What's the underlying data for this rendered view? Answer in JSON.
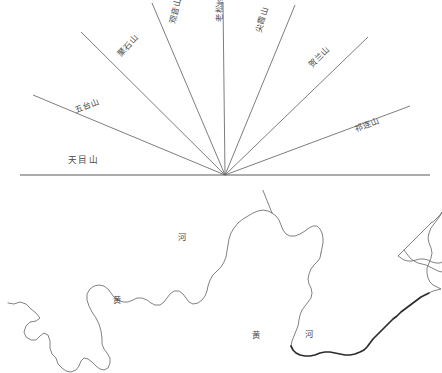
{
  "figure": {
    "background_color": "#ffffff",
    "line_color": "#6e6e6e",
    "text_color": "#4a4a4a"
  },
  "fan_diagram": {
    "name": "mountain-ray-fan",
    "origin": {
      "x": 225,
      "y": 175
    },
    "baseline": {
      "label": "天目山",
      "x1": 20,
      "y1": 175,
      "x2": 430,
      "y2": 175,
      "label_x": 68,
      "label_y": 163
    },
    "rays": [
      {
        "label": "五台山",
        "x1": 33,
        "y1": 95,
        "angle_deg": 202,
        "label_x": 76,
        "label_y": 113,
        "rotate": 22
      },
      {
        "label": "聚石山",
        "x1": 81,
        "y1": 32,
        "angle_deg": 221,
        "label_x": 121,
        "label_y": 57,
        "rotate": 48
      },
      {
        "label": "观音山",
        "x1": 152,
        "y1": 3,
        "angle_deg": 249,
        "label_x": 175,
        "label_y": 24,
        "rotate": 76
      },
      {
        "label": "老松岭",
        "x1": 223,
        "y1": 2,
        "angle_deg": 270,
        "label_x": 222,
        "label_y": 22,
        "rotate": 88
      },
      {
        "label": "尖霞山",
        "x1": 295,
        "y1": 5,
        "angle_deg": 291,
        "label_x": 261,
        "label_y": 33,
        "rotate": 74
      },
      {
        "label": "贺兰山",
        "x1": 368,
        "y1": 37,
        "angle_deg": 317,
        "label_x": 312,
        "label_y": 68,
        "rotate": 45
      },
      {
        "label": "祁连山",
        "x1": 410,
        "y1": 106,
        "angle_deg": 338,
        "label_x": 356,
        "label_y": 132,
        "rotate": 22
      }
    ]
  },
  "river_map": {
    "name": "yellow-river-course",
    "labels": [
      {
        "text": "河",
        "x": 178,
        "y": 240
      },
      {
        "text": "黄",
        "x": 113,
        "y": 303
      },
      {
        "text": "黄",
        "x": 252,
        "y": 338
      },
      {
        "text": "河",
        "x": 305,
        "y": 337
      }
    ],
    "segments": [
      {
        "name": "upper-source-western",
        "weight": "thin",
        "d": "M8 303 L14 304 L20 302 L26 304 L31 309 L36 313 L40 318 L36 321 L30 322 L26 326 L24 332 L26 337 L31 340 L36 340 L40 336 L44 333 L48 335 L50 341 L50 348 L52 354 L56 358 L58 364 L62 368 L66 371 L71 372 L76 370 L79 366 L81 361 L84 358 L88 359 L92 362 L96 366 L100 369 L104 370 L108 368 L110 363 L110 358 L107 353 L104 349 L102 344 L102 338 L101 331 L99 324 L96 318 L92 312 L89 306 L87 300 L87 294 L90 289 L94 286 L99 285 L104 286 L108 289 L111 293 L114 297 L118 300 L123 302 L128 302 L133 300 L137 298 L142 298 L147 300 L151 303 L155 305 L160 305 L164 302 L167 298 L170 294 L174 291 L179 291 L183 294 L186 298 L189 302 L193 304 L198 303 L202 300 L205 296 L207 291 L208 286 L210 280 L213 275 L217 271 L221 267 L224 262 L226 257 L227 251 L228 245 L229 239 L231 233 L234 228 L238 223 L243 219 L248 216 L253 213 L258 211 L263 210 L268 211 L272 213"
      },
      {
        "name": "ordos-loop-north",
        "weight": "thin",
        "d": "M272 213 L276 216 L279 220 L281 225 L283 230 L286 234 L290 236 L295 236 L300 234 L305 231 L309 228 L313 226 L317 226 L320 229 L322 233 L323 238 L323 243 L322 248 L321 253"
      },
      {
        "name": "ordos-loop-east",
        "weight": "thin",
        "d": "M321 253 L320 258 L317 262 L314 265 L311 269 L309 274 L308 279 L309 284 L311 288 L312 293 L311 298 L308 302 L305 306 L302 310 L300 315 L299 320 L298 326 L296 331 L294 336 L292 341 L291 346"
      },
      {
        "name": "lower-southern-bend",
        "weight": "thick",
        "d": "M291 346 L293 350 L296 353 L300 355 L305 356 L310 356 L315 355 L320 353 L325 352 L330 352 L335 353 L340 354 L345 355 L350 355 L355 354 L360 352 L364 350 L367 347 L370 343 L373 339 L377 335 L381 331 L385 327 L389 323 L393 319 L397 316 L401 312 L405 309 L409 306 L413 303 L417 300 L421 297 L425 295 L429 293"
      },
      {
        "name": "delta-eastern-outlet",
        "weight": "thin",
        "d": "M429 293 L433 291 L437 290 L441 289 L437 287 L433 285 L430 282 L428 278 L427 273 L427 268 L429 263 L431 258 L432 253 L431 248 L429 243 L428 238 L429 233 L431 228 L434 224 L437 220 L440 216 L442 212 L440 215 L437 218 L434 221 L431 223"
      },
      {
        "name": "estuary-branch-upper",
        "weight": "thin",
        "d": "M431 223 L428 226 L425 229 L422 232 L419 235 L416 238 L413 241 L410 244 L407 247 L404 250 L401 253 L398 256 L401 258 L404 260 L408 261 L412 261 L416 260 L420 259 L424 259 L428 260 L432 262 L436 263 L440 263 L442 262"
      },
      {
        "name": "estuary-branch-lower",
        "weight": "thin",
        "d": "M404 250 L407 254 L410 258 L414 261 L418 263 L422 264 L426 265 L430 267 L434 269 L438 271 L442 272"
      },
      {
        "name": "shanxi-gorge-west-bank",
        "weight": "thin",
        "d": "M272 213 L270 208 L268 203 L266 198 L264 193 L262 188 L261 183 L262 178 L264 173 L267 169 L270 166 L274 163 L278 161 L282 160 L287 160 L292 161 L297 163 L302 165 L307 166"
      },
      {
        "name": "inner-mongolia-north-arc",
        "weight": "thin",
        "d": "M307 166 L311 166 L315 164 L318 161 L320 157 L321 152 L320 147 L318 142 L315 138 L311 134 L307 131 L302 129 L297 128 L292 128 L287 130 L282 132 L277 134 L272 135 L267 135 L262 133 L258 130 L255 126 L253 122 L252 117 L252 112 L254 107 L257 103 L261 100 L265 98 L270 97 L275 97 L280 98 L284 100"
      },
      {
        "name": "hetao-plain-bend",
        "weight": "thin",
        "d": "M284 100 L282 95 L280 90 L277 86 L273 82 L268 79 L263 77 L258 76 L253 76 L248 77 L243 79 L238 81 L233 83 L228 84 L223 83 L219 81 L216 78 L214 74 L213 69 L213 64 L214 59"
      },
      {
        "name": "upper-reach-north-hook",
        "weight": "thin",
        "d": "M214 59 L212 55 L209 52 L205 50 L201 49 L196 49 L191 50 L186 52 L181 55 L177 59 L174 63 L172 68 L171 73 L170 78 L169 83 L167 88 L164 92 L161 96 L158 100 L155 104 L153 109 L152 114 L152 119 L153 124 L155 129 L157 133 L158 138"
      },
      {
        "name": "loess-plateau-descent",
        "weight": "mid",
        "d": "M158 138 L156 142 L153 146 L150 149 L146 152 L142 154 L138 156 L133 157 L128 158 L123 158 L118 157 L113 156 L108 156 L103 157 L98 159 L93 161 L88 162 L83 162 L78 161 L73 159 L68 157 L63 156 L58 156 L53 157 L48 159 L43 161 L38 162 L33 162"
      }
    ]
  },
  "caption": {
    "faint_text": ""
  }
}
